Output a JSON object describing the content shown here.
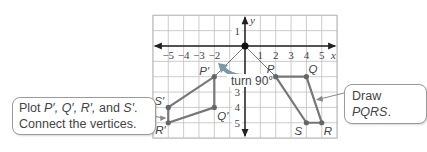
{
  "graph": {
    "x_label": "x",
    "y_label": "y",
    "x_range": [
      -6,
      6
    ],
    "y_range": [
      -6,
      2
    ],
    "x_ticks": [
      {
        "v": -5,
        "label": "−5"
      },
      {
        "v": -4,
        "label": "−4"
      },
      {
        "v": -3,
        "label": "−3"
      },
      {
        "v": -2,
        "label": "−2"
      },
      {
        "v": 1,
        "label": "1"
      },
      {
        "v": 2,
        "label": "2"
      },
      {
        "v": 3,
        "label": "3"
      },
      {
        "v": 4,
        "label": "4"
      },
      {
        "v": 5,
        "label": "5"
      }
    ],
    "y_ticks": [
      {
        "v": 1,
        "label": "1"
      },
      {
        "v": -3,
        "label": "3"
      },
      {
        "v": -4,
        "label": "4"
      },
      {
        "v": -5,
        "label": "5"
      }
    ],
    "rotation_label": "turn 90°",
    "original": {
      "P": [
        2,
        -2
      ],
      "Q": [
        4,
        -2
      ],
      "R": [
        5,
        -5
      ],
      "S": [
        4,
        -5
      ]
    },
    "image": {
      "P'": [
        -2,
        -2
      ],
      "Q'": [
        -2,
        -4
      ],
      "R'": [
        -5,
        -5
      ],
      "S'": [
        -5,
        -4
      ]
    },
    "labels": {
      "P": "P",
      "Q": "Q",
      "R": "R",
      "S": "S",
      "P'": "P′",
      "Q'": "Q′",
      "R'": "R′",
      "S'": "S′"
    },
    "line_color": "#777777",
    "grid_color": "#bfbfbf"
  },
  "callouts": {
    "left_line1_a": "Plot ",
    "left_line1_b": "P′, Q′, R′,",
    "left_line1_c": " and ",
    "left_line1_d": "S′",
    "left_line1_e": ".",
    "left_line2": "Connect the vertices.",
    "right_a": "Draw ",
    "right_b": "PQRS",
    "right_c": "."
  }
}
